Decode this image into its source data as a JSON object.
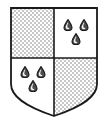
{
  "figure": {
    "name": "heraldic-shield",
    "title": "Quartered heraldic shield with gouttes",
    "canvas": {
      "width": 109,
      "height": 124
    },
    "background_color": "#ffffff"
  },
  "shield": {
    "outline_color": "#1a1a1a",
    "outline_width": 1.6,
    "field_color": "#ffffff",
    "geometry": {
      "left": 11,
      "right": 97,
      "top": 8,
      "bottom_point_y": 116,
      "center_x": 54,
      "fess_y": 58,
      "shoulder_y": 84
    },
    "division": {
      "name": "quarterly",
      "pale_x": 54,
      "fess_y": 58,
      "line_color": "#1a1a1a",
      "line_width": 1.6
    }
  },
  "pattern": {
    "name": "checky",
    "cell_size": 2,
    "light_color": "#ffffff",
    "dark_color": "#c6c6c6"
  },
  "charge": {
    "name": "goutte",
    "label": "water droplet",
    "count_per_quarter": 3,
    "arrangement": "two and one",
    "outline_color": "#1a1a1a",
    "body_color": "#4d4d4d",
    "highlight_color": "#f2f2f2",
    "width": 8,
    "height": 11
  },
  "quarters": [
    {
      "position": "1",
      "name": "top-left",
      "tincture": "checky",
      "charges": []
    },
    {
      "position": "2",
      "name": "top-right",
      "tincture": "plain",
      "charges": [
        {
          "cx": 68,
          "cy": 25
        },
        {
          "cx": 84,
          "cy": 25
        },
        {
          "cx": 76,
          "cy": 39
        }
      ]
    },
    {
      "position": "3",
      "name": "bottom-left",
      "tincture": "plain",
      "charges": [
        {
          "cx": 25,
          "cy": 72
        },
        {
          "cx": 41,
          "cy": 72
        },
        {
          "cx": 33,
          "cy": 86
        }
      ]
    },
    {
      "position": "4",
      "name": "bottom-right",
      "tincture": "checky",
      "charges": []
    }
  ]
}
